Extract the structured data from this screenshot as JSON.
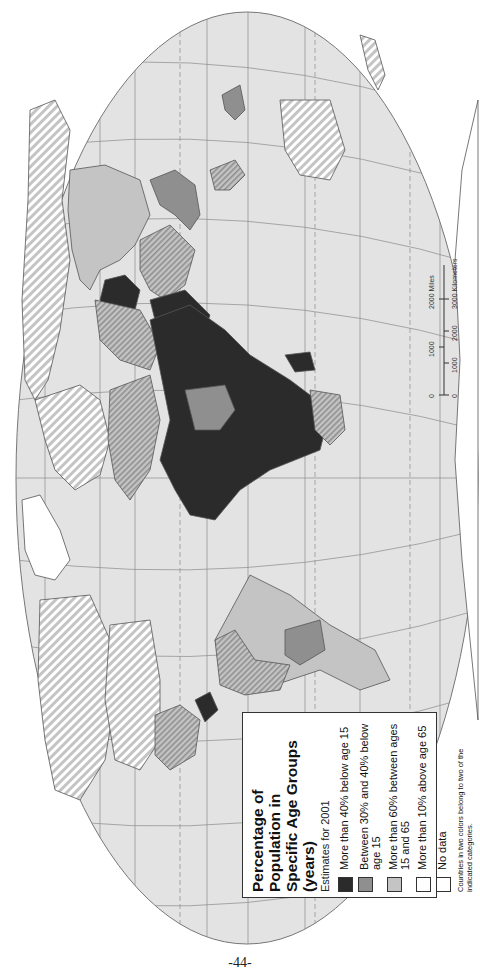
{
  "map": {
    "title": "Percentage of Population in Specific Age Groups (years)",
    "subtitle": "Estimates for 2001",
    "orientation": "rotated 90 degrees counter-clockwise (north to the left)",
    "colors": {
      "ocean": "#e3e3e3",
      "graticule": "#8a8a8a",
      "below15_over40": "#2b2b2b",
      "below15_30to40": "#8f8f8f",
      "age15to65_over60": "#c4c4c4",
      "above65_over10": "#ffffff",
      "no_data": "#ffffff",
      "border": "#555555"
    }
  },
  "legend": {
    "title_line1": "Percentage of Population in",
    "title_line2": "Specific Age Groups (years)",
    "subtitle": "Estimates for 2001",
    "items": [
      {
        "label": "More than 40% below age 15",
        "swatch": "#2b2b2b"
      },
      {
        "label": "Between 30% and 40% below age 15",
        "swatch": "#8f8f8f"
      },
      {
        "label": "More than 60% between ages 15 and 65",
        "swatch": "#c4c4c4"
      },
      {
        "label": "More than 10% above age 65",
        "swatch": "#ffffff"
      },
      {
        "label": "No data",
        "swatch": "#ffffff"
      }
    ],
    "note": "Countries in two colors belong to two of the indicated categories."
  },
  "scale_bar": {
    "miles_ticks": [
      "0",
      "1000",
      "2000 Miles"
    ],
    "km_ticks": [
      "0",
      "1000",
      "2000",
      "3000 Kilometers"
    ]
  },
  "page": {
    "number": "-44-"
  }
}
